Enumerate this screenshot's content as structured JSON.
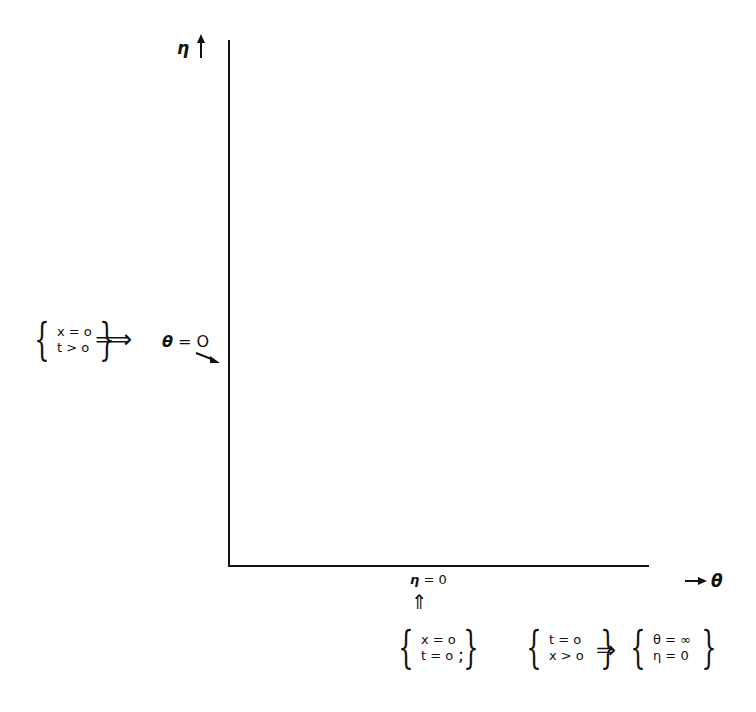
{
  "diagram": {
    "axes": {
      "vertical": {
        "label": "η",
        "arrow": "↑"
      },
      "horizontal": {
        "label": "θ",
        "arrow": "→"
      }
    },
    "left_condition": {
      "lines": [
        "x = o",
        "t > o"
      ],
      "implies": "⟹",
      "result": "θ = O"
    },
    "bottom_axis_label": "η = 0",
    "bottom_arrow": "⇑",
    "origin_condition": {
      "lines": [
        "x = o",
        "t = o"
      ],
      "separator": ";"
    },
    "initial_condition": {
      "lines": [
        "t = o",
        "x > o"
      ],
      "implies": "⇒",
      "result_lines": [
        "θ = ∞",
        "η = 0"
      ]
    }
  }
}
